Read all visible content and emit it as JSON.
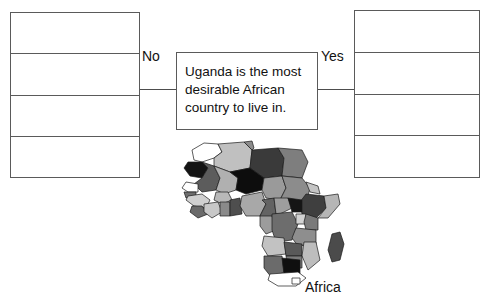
{
  "diagram": {
    "type": "decision-flow",
    "statement": {
      "text": "Uganda is the most desirable African country to live in."
    },
    "branches": {
      "no_label": "No",
      "yes_label": "Yes"
    },
    "left_table": {
      "name": "no-answers-table",
      "row_count": 4,
      "rows": [
        "",
        "",
        "",
        ""
      ]
    },
    "right_table": {
      "name": "yes-answers-table",
      "row_count": 4,
      "rows": [
        "",
        "",
        "",
        ""
      ]
    },
    "map": {
      "caption": "Africa",
      "region": "Africa",
      "shading": "choropleth-grayscale",
      "palette": {
        "lightest": "#c8c8c8",
        "light": "#b4b4b4",
        "mid": "#8c8c8c",
        "dark": "#646464",
        "darker": "#4a4a4a",
        "black": "#0d0d0d",
        "white": "#ffffff",
        "outline": "#1a1a1a"
      }
    },
    "colors": {
      "background": "#ffffff",
      "line": "#5a5a5a",
      "text": "#111111"
    }
  }
}
